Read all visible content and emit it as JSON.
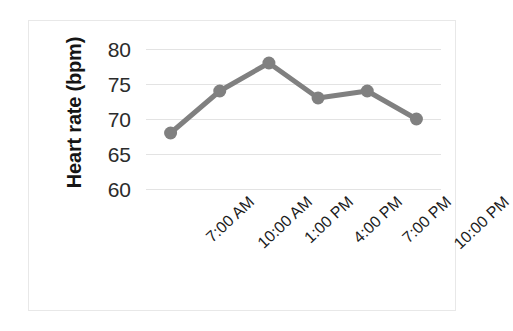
{
  "chart_data": {
    "type": "line",
    "title": "",
    "xlabel": "",
    "ylabel": "Heart rate (bpm)",
    "categories": [
      "7:00 AM",
      "10:00 AM",
      "1:00 PM",
      "4:00 PM",
      "7:00 PM",
      "10:00 PM"
    ],
    "values": [
      68,
      74,
      78,
      73,
      74,
      70
    ],
    "series": [
      {
        "name": "Heart rate",
        "values": [
          68,
          74,
          78,
          73,
          74,
          70
        ]
      }
    ],
    "ylim": [
      60,
      80
    ],
    "yticks": [
      60,
      65,
      70,
      75,
      80
    ],
    "ytick_labels": [
      "60",
      "65",
      "70",
      "75",
      "80"
    ],
    "grid": true,
    "grid_axis": "y",
    "legend": false,
    "legend_position": "none",
    "marker": "circle",
    "series_color": "#808080",
    "gridline_color": "#e3e3e3",
    "border_color": "#e8e8e8",
    "background_color": "#ffffff",
    "text_color": "#1c1c1c"
  },
  "axis": {
    "y_title": "Heart rate (bpm)"
  }
}
